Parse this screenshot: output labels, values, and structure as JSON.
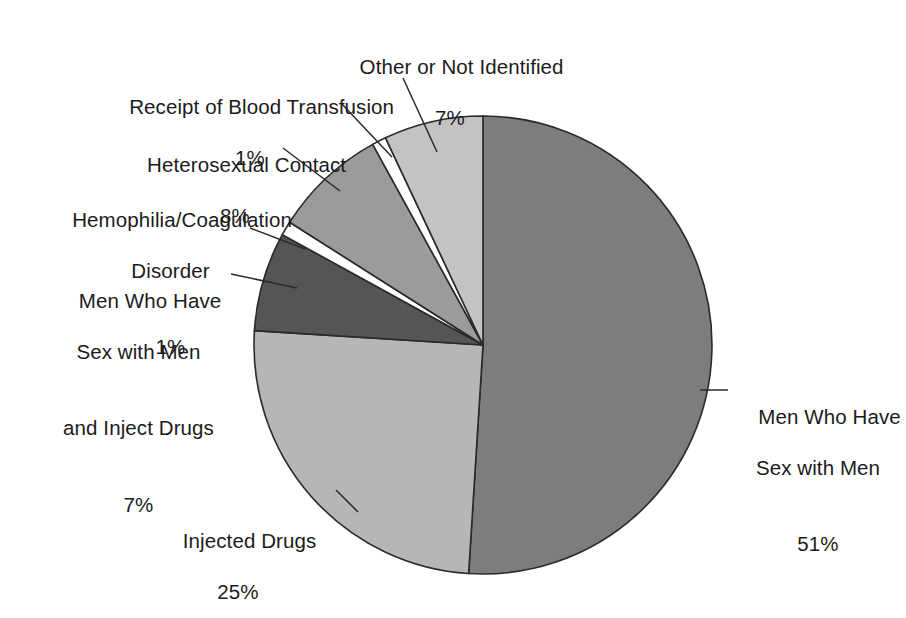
{
  "chart_data": {
    "type": "pie",
    "title": "",
    "subtitle": "",
    "xlabel": "",
    "ylabel": "",
    "legend_position": "none",
    "grid": false,
    "units": "percent",
    "start_angle_deg": 0,
    "direction": "clockwise",
    "categories": [
      "Men Who Have Sex with Men",
      "Injected Drugs",
      "Men Who Have Sex with Men and Inject Drugs",
      "Hemophilia/Coagulation Disorder",
      "Heterosexual Contact",
      "Receipt of Blood Transfusion",
      "Other or Not Identified"
    ],
    "values": [
      51,
      25,
      7,
      1,
      8,
      1,
      7
    ],
    "value_labels": [
      "51%",
      "25%",
      "7%",
      "1%",
      "8%",
      "1%",
      "7%"
    ],
    "colors": [
      "#7d7d7d",
      "#b6b6b6",
      "#555555",
      "#ffffff",
      "#9b9b9b",
      "#ffffff",
      "#c3c3c3"
    ],
    "slices": [
      {
        "name": "Men Who Have Sex with Men",
        "label_lines": [
          "Men Who Have",
          "Sex with Men"
        ],
        "percent_text": "51%",
        "value": 51,
        "color": "#7d7d7d"
      },
      {
        "name": "Injected Drugs",
        "label_lines": [
          "Injected Drugs"
        ],
        "percent_text": "25%",
        "value": 25,
        "color": "#b6b6b6"
      },
      {
        "name": "Men Who Have Sex with Men and Inject Drugs",
        "label_lines": [
          "Men Who Have",
          "Sex with Men",
          "and Inject Drugs"
        ],
        "percent_text": "7%",
        "value": 7,
        "color": "#555555"
      },
      {
        "name": "Hemophilia/Coagulation Disorder",
        "label_lines": [
          "Hemophilia/Coagulation",
          "Disorder"
        ],
        "percent_text": "1%",
        "value": 1,
        "color": "#ffffff"
      },
      {
        "name": "Heterosexual Contact",
        "label_lines": [
          "Heterosexual Contact"
        ],
        "percent_text": "8%",
        "value": 8,
        "color": "#9b9b9b"
      },
      {
        "name": "Receipt of Blood Transfusion",
        "label_lines": [
          "Receipt of Blood Transfusion"
        ],
        "percent_text": "1%",
        "value": 1,
        "color": "#ffffff"
      },
      {
        "name": "Other or Not Identified",
        "label_lines": [
          "Other or Not Identified"
        ],
        "percent_text": "7%",
        "value": 7,
        "color": "#c3c3c3"
      }
    ]
  },
  "labels": {
    "other_not_identified": {
      "line1": "Other or Not Identified",
      "pct": "7%"
    },
    "blood_transfusion": {
      "line1": "Receipt of Blood Transfusion",
      "pct": "1%"
    },
    "heterosexual_contact": {
      "line1": "Heterosexual Contact",
      "pct": "8%"
    },
    "hemophilia": {
      "line1": "Hemophilia/Coagulation",
      "line2": "Disorder",
      "pct": "1%"
    },
    "msm_inject": {
      "line1": "Men Who Have",
      "line2": "Sex with Men",
      "line3": "and Inject Drugs",
      "pct": "7%"
    },
    "msm": {
      "line1": "Men Who Have",
      "line2": "Sex with Men",
      "pct": "51%"
    },
    "injected_drugs": {
      "line1": "Injected Drugs",
      "pct": "25%"
    }
  }
}
